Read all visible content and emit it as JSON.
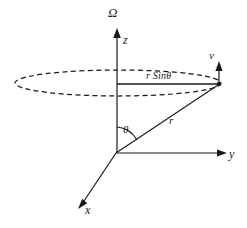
{
  "figure": {
    "background_color": "#ffffff",
    "line_color": "#1a1a1a",
    "width": 247,
    "height": 228,
    "labels": {
      "omega": "Ω",
      "z_axis": "z",
      "y_axis": "y",
      "x_axis": "x",
      "velocity": "v",
      "radius": "r",
      "polar_angle": "θ",
      "projection": "r Sinθ"
    },
    "geometry": {
      "origin": {
        "x": 116,
        "y": 153
      },
      "particle": {
        "x": 219,
        "y": 84
      },
      "z_axis_tip": {
        "x": 117,
        "y": 30
      },
      "y_axis_tip": {
        "x": 226,
        "y": 153
      },
      "x_axis_tip": {
        "x": 79,
        "y": 206
      },
      "velocity_arrow_tip": {
        "x": 219,
        "y": 62
      },
      "orbit_ellipse": {
        "cx": 118,
        "cy": 83,
        "rx": 103,
        "ry": 13
      },
      "projection_line": {
        "x1": 117,
        "y1": 84,
        "x2": 218,
        "y2": 84
      },
      "theta_arc_radius": 26
    }
  }
}
